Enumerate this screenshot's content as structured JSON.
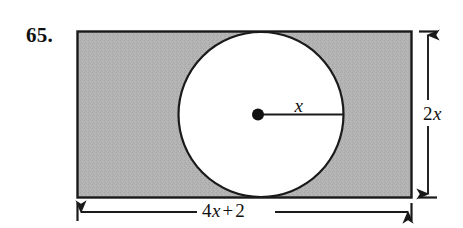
{
  "figure": {
    "problem_number": "65.",
    "shape_description": "shaded rectangle with inscribed white circle",
    "colors": {
      "shading": "#b3b3b3",
      "outline": "#1a1a1a",
      "circle_fill": "#ffffff",
      "page_background": "#ffffff",
      "text": "#111111"
    },
    "labels": {
      "radius": {
        "coefficient": "",
        "variable": "x",
        "full": "x"
      },
      "height": {
        "coefficient": "2",
        "variable": "x",
        "full": "2x"
      },
      "width": {
        "coefficient": "4",
        "variable": "x",
        "operator": "+",
        "constant": "2",
        "full": "4x + 2"
      }
    },
    "geometry": {
      "rect_left": 77,
      "rect_top": 31,
      "rect_right": 412,
      "rect_bottom": 198,
      "circle_center_x": 261,
      "circle_center_y": 114,
      "circle_radius": 83,
      "center_dot_radius": 6,
      "radius_line_end_x": 344,
      "vertical_dim_x": 428,
      "horizontal_dim_y": 212
    }
  }
}
